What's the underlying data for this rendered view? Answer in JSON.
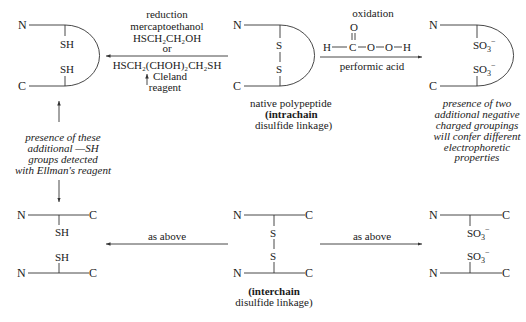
{
  "colors": {
    "ink": "#1a1a1a",
    "background": "#ffffff"
  },
  "atoms": {
    "N": "N",
    "C": "C",
    "S": "S",
    "SH": "SH",
    "SO3": "SO",
    "sub3": "3",
    "minus": "−"
  },
  "reduction": {
    "title": "reduction",
    "reagent1_name": "mercaptoethanol",
    "reagent1_formula": "HSCH₂CH₂OH",
    "or": "or",
    "reagent2_formula": "HSCH₂(CHOH)₂CH₂SH",
    "reagent2_name_line1": "Cleland",
    "reagent2_name_line2": "reagent"
  },
  "oxidation": {
    "title": "oxidation",
    "formula_H1": "H",
    "formula_C": "C",
    "formula_O_top": "O",
    "formula_O1": "O",
    "formula_O2": "O",
    "formula_H2": "H",
    "name": "performic acid"
  },
  "native_intrachain": {
    "line1": "native polypeptide",
    "line2": "(intrachain",
    "line3": "disulfide linkage)"
  },
  "reduced_note": {
    "lines": [
      "presence of these",
      "additional —SH",
      "groups detected",
      "with Ellman's reagent"
    ]
  },
  "oxidized_note": {
    "lines": [
      "presence of two",
      "additional negative",
      "charged groupings",
      "will confer different",
      "electrophoretic",
      "properties"
    ]
  },
  "interchain": {
    "line1": "(interchain",
    "line2": "disulfide linkage)"
  },
  "as_above_left": "as above",
  "as_above_right": "as above"
}
